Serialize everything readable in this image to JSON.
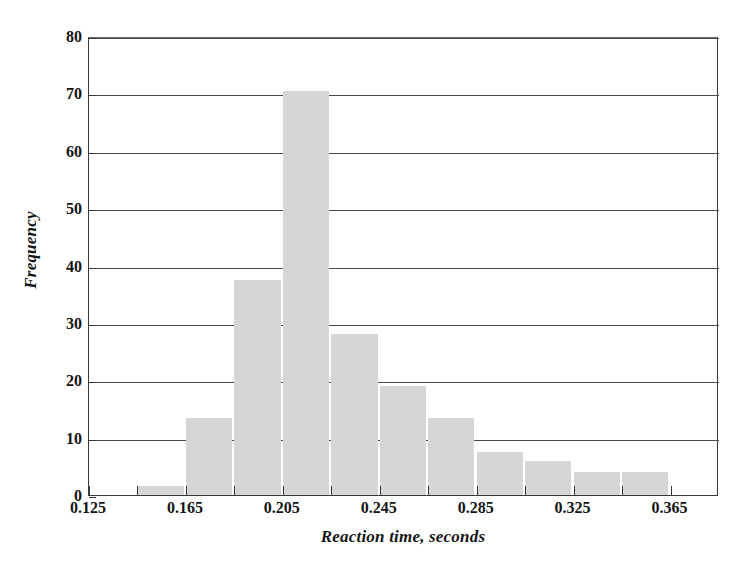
{
  "chart_data": {
    "type": "bar",
    "title": "",
    "subtitle": "",
    "xlabel": "Reaction time, seconds",
    "ylabel": "Frequency",
    "xlim": [
      0.125,
      0.385
    ],
    "ylim": [
      0,
      80
    ],
    "grid": true,
    "legend": false,
    "bin_width": 0.02,
    "bar_color": "#d6d6d6",
    "axis_color": "#3a3a3a",
    "categories": [
      "0.145-0.165",
      "0.165-0.185",
      "0.185-0.205",
      "0.205-0.225",
      "0.225-0.245",
      "0.245-0.265",
      "0.265-0.285",
      "0.285-0.305",
      "0.305-0.325",
      "0.325-0.345",
      "0.345-0.365"
    ],
    "bin_starts": [
      0.145,
      0.165,
      0.185,
      0.205,
      0.225,
      0.245,
      0.265,
      0.285,
      0.305,
      0.325,
      0.345
    ],
    "values": [
      1.5,
      13.5,
      37.5,
      70.5,
      28,
      19,
      13.5,
      7.5,
      6,
      4,
      4
    ],
    "xticks": [
      0.125,
      0.145,
      0.165,
      0.185,
      0.205,
      0.225,
      0.245,
      0.265,
      0.285,
      0.305,
      0.325,
      0.345,
      0.365
    ],
    "xtick_labels": [
      "0.125",
      "",
      "0.165",
      "",
      "0.205",
      "",
      "0.245",
      "",
      "0.285",
      "",
      "0.325",
      "",
      "0.365"
    ],
    "yticks": [
      0,
      10,
      20,
      30,
      40,
      50,
      60,
      70,
      80
    ],
    "ytick_labels": [
      "0",
      "10",
      "20",
      "30",
      "40",
      "50",
      "60",
      "70",
      "80"
    ]
  }
}
